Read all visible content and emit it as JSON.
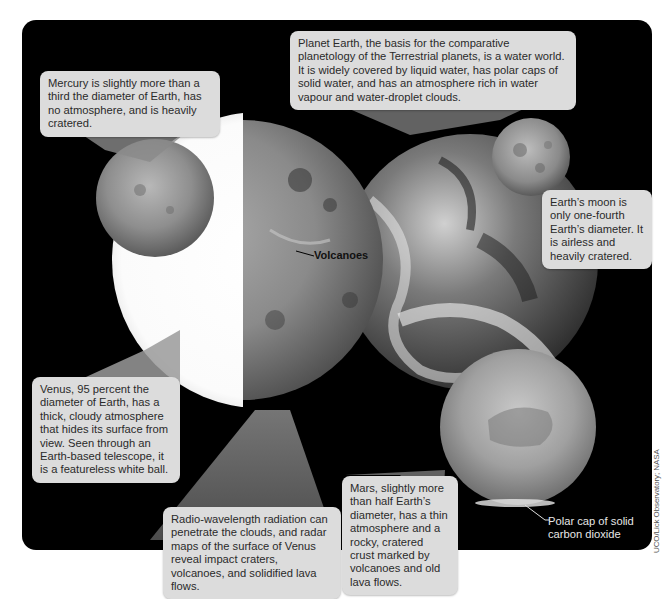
{
  "figure": {
    "colors": {
      "background": "#000000",
      "callout_bg": "#dcdcdc",
      "callout_text": "#2a2a2a"
    }
  },
  "callouts": {
    "mercury": "Mercury is slightly more than a third the diameter of Earth, has no atmosphere, and is heavily cratered.",
    "earth": "Planet Earth, the basis for the comparative planetology of the Terrestrial planets, is a water world. It is widely covered by liquid water, has polar caps of solid water, and has an atmosphere rich in water vapour and water-droplet clouds.",
    "moon": "Earth’s moon is only one-fourth Earth’s diameter. It is airless and heavily cratered.",
    "venus": "Venus, 95 percent the diameter of Earth, has a thick, cloudy atmosphere that hides its surface from view. Seen through an Earth-based telescope, it is a featureless white ball.",
    "radar": "Radio-wavelength radiation can penetrate the clouds, and radar maps of the surface of Venus reveal impact craters, volcanoes, and solidified lava flows.",
    "mars": "Mars, slightly more than half Earth’s diameter, has a thin atmosphere and a rocky, cratered crust marked by volcanoes and old lava flows."
  },
  "labels": {
    "volcanoes": "Volcanoes",
    "polar_cap": "Polar cap of solid carbon dioxide"
  },
  "credit": "UCO/Lick Observatory; NASA"
}
